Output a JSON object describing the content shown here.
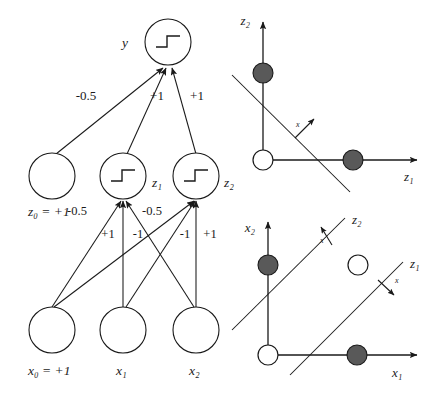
{
  "figure": {
    "type": "neural-network-diagram"
  },
  "colors": {
    "stroke": "#1a1a1a",
    "background": "#ffffff",
    "filled_point": "#595959",
    "open_point": "#ffffff",
    "point_outline": "#1a1a1a"
  },
  "network": {
    "output_layer": {
      "nodes": [
        {
          "id": "y",
          "label": "y",
          "activation": "step",
          "cx": 168,
          "cy": 42,
          "r": 23
        }
      ]
    },
    "hidden_layer": {
      "nodes": [
        {
          "id": "z0",
          "label": "z₀ = +1",
          "activation": "none",
          "cx": 52,
          "cy": 176,
          "r": 23
        },
        {
          "id": "z1",
          "label": "z₁",
          "activation": "step",
          "cx": 123,
          "cy": 176,
          "r": 23
        },
        {
          "id": "z2",
          "label": "z₂",
          "activation": "step",
          "cx": 196,
          "cy": 176,
          "r": 23
        }
      ]
    },
    "input_layer": {
      "nodes": [
        {
          "id": "x0",
          "label": "x₀ = +1",
          "activation": "none",
          "cx": 52,
          "cy": 330,
          "r": 23
        },
        {
          "id": "x1",
          "label": "x₁",
          "activation": "none",
          "cx": 123,
          "cy": 330,
          "r": 23
        },
        {
          "id": "x2",
          "label": "x₂",
          "activation": "none",
          "cx": 196,
          "cy": 330,
          "r": 23
        }
      ]
    },
    "output_weights": [
      {
        "from": "z0",
        "to": "y",
        "label": "-0.5",
        "lx": 86,
        "ly": 100
      },
      {
        "from": "z1",
        "to": "y",
        "label": "+1",
        "lx": 157,
        "ly": 100
      },
      {
        "from": "z2",
        "to": "y",
        "label": "+1",
        "lx": 197,
        "ly": 100
      }
    ],
    "hidden_weights": [
      {
        "from": "x0",
        "to": "z1",
        "label": "-0.5",
        "lx": 77,
        "ly": 215
      },
      {
        "from": "x1",
        "to": "z1",
        "label": "+1",
        "lx": 108,
        "ly": 237
      },
      {
        "from": "x2",
        "to": "z1",
        "label": "-1",
        "lx": 137,
        "ly": 237
      },
      {
        "from": "x0",
        "to": "z2",
        "label": "-0.5",
        "lx": 152,
        "ly": 215
      },
      {
        "from": "x1",
        "to": "z2",
        "label": "-1",
        "lx": 184,
        "ly": 237
      },
      {
        "from": "x2",
        "to": "z2",
        "label": "+1",
        "lx": 208,
        "ly": 237
      }
    ]
  },
  "plot_top": {
    "name": "z-space-decision-plot",
    "axis_x_label": "z₁",
    "axis_y_label": "z₂",
    "points": [
      {
        "label": "origin",
        "fill": "open",
        "x": 0,
        "y": 0
      },
      {
        "label": "upper",
        "fill": "filled",
        "x": 0,
        "y": 1
      },
      {
        "label": "right",
        "fill": "filled",
        "x": 1,
        "y": 0
      }
    ],
    "lines": [
      {
        "name": "output-decision-boundary",
        "normal_label": "x"
      }
    ]
  },
  "plot_bottom": {
    "name": "x-space-decision-plot",
    "axis_x_label": "x₁",
    "axis_y_label": "x₂",
    "points": [
      {
        "label": "origin",
        "fill": "open",
        "x": 0,
        "y": 0
      },
      {
        "label": "upper",
        "fill": "filled",
        "x": 0,
        "y": 1
      },
      {
        "label": "right",
        "fill": "filled",
        "x": 1,
        "y": 0
      },
      {
        "label": "corner",
        "fill": "open",
        "x": 1,
        "y": 1
      }
    ],
    "lines": [
      {
        "name": "z2-decision-boundary",
        "line_label": "z₂",
        "normal_label": "x"
      },
      {
        "name": "z1-decision-boundary",
        "line_label": "z₁",
        "normal_label": "x"
      }
    ]
  }
}
